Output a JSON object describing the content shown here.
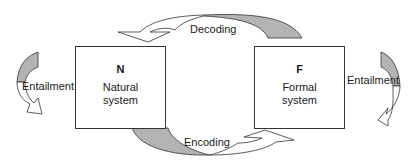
{
  "diagram": {
    "nodes": [
      {
        "id": "N",
        "symbol": "N",
        "name_line1": "Natural",
        "name_line2": "system"
      },
      {
        "id": "F",
        "symbol": "F",
        "name_line1": "Formal",
        "name_line2": "system"
      }
    ],
    "edges": [
      {
        "id": "decoding",
        "label": "Decoding",
        "from": "F",
        "to": "N"
      },
      {
        "id": "encoding",
        "label": "Encoding",
        "from": "N",
        "to": "F"
      },
      {
        "id": "entailment-natural",
        "label": "Entailment",
        "from": "N",
        "to": "N"
      },
      {
        "id": "entailment-formal",
        "label": "Entailment",
        "from": "F",
        "to": "F"
      }
    ],
    "colors": {
      "arrow_fill": "#ffffff",
      "arrow_shade": "#b3b3b3",
      "stroke": "#333333"
    }
  }
}
